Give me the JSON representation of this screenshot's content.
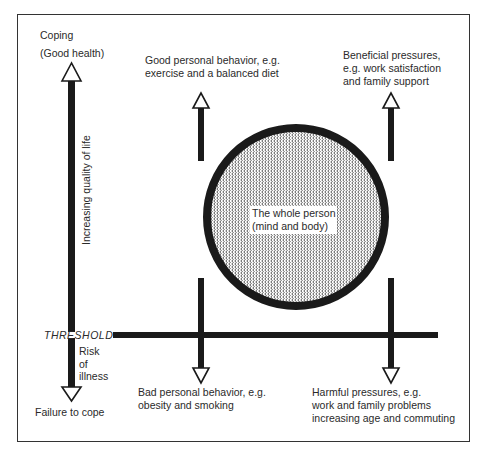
{
  "diagram": {
    "left_axis": {
      "top_label_line1": "Coping",
      "top_label_line2": "(Good health)",
      "vertical_label": "Increasing quality of life",
      "threshold_label": "THRESHOLD",
      "risk_label": [
        "Risk",
        "of",
        "illness"
      ],
      "bottom_label": "Failure to cope"
    },
    "top_left": {
      "lines": [
        "Good personal behavior, e.g.",
        "exercise and a balanced diet"
      ]
    },
    "top_right": {
      "lines": [
        "Beneficial pressures,",
        "e.g. work satisfaction",
        "and family support"
      ]
    },
    "bottom_left": {
      "lines": [
        "Bad personal behavior, e.g.",
        "obesity and smoking"
      ]
    },
    "bottom_right": {
      "lines": [
        "Harmful pressures, e.g.",
        "work and family problems",
        "increasing age and commuting"
      ]
    },
    "center": {
      "lines": [
        "The whole person",
        "(mind and body)"
      ]
    },
    "colors": {
      "stroke": "#1a1a1a",
      "frame": "#333333",
      "background": "#ffffff"
    }
  }
}
